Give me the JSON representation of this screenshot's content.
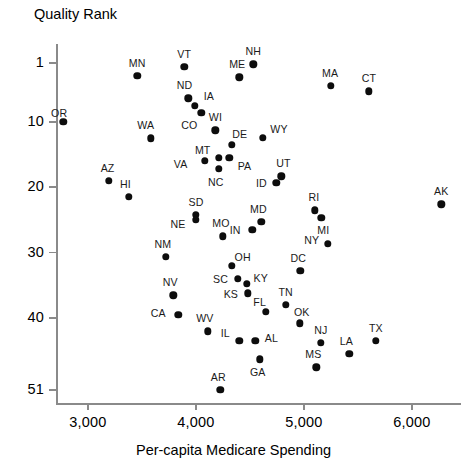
{
  "chart_data": {
    "type": "scatter",
    "title": "",
    "xlabel": "Per-capita Medicare Spending",
    "ylabel": "Quality Rank",
    "xlim": [
      2700,
      6450
    ],
    "ylim": [
      1,
      51
    ],
    "y_inverted": true,
    "grid": false,
    "legend": "none",
    "xticks": [
      3000,
      4000,
      5000,
      6000
    ],
    "xtick_labels": [
      "3,000",
      "4,000",
      "5,000",
      "6,000"
    ],
    "yticks": [
      1,
      10,
      20,
      30,
      40,
      51
    ],
    "ytick_labels": [
      "1",
      "10",
      "20",
      "30",
      "40",
      "51"
    ],
    "point_label_position": "varies",
    "points": [
      {
        "label": "OR",
        "x": 2770,
        "y": 10,
        "lx": -4,
        "ly": -9
      },
      {
        "label": "MN",
        "x": 3455,
        "y": 3,
        "lx": 0,
        "ly": -13
      },
      {
        "label": "VT",
        "x": 3890,
        "y": 1.6,
        "lx": 0,
        "ly": -13
      },
      {
        "label": "NH",
        "x": 4530,
        "y": 1.2,
        "lx": 0,
        "ly": -13
      },
      {
        "label": "ME",
        "x": 4400,
        "y": 3.2,
        "lx": -2,
        "ly": -13
      },
      {
        "label": "MA",
        "x": 5250,
        "y": 4.5,
        "lx": -1,
        "ly": -13
      },
      {
        "label": "CT",
        "x": 5600,
        "y": 5.3,
        "lx": 0,
        "ly": -13
      },
      {
        "label": "ND",
        "x": 3930,
        "y": 6.4,
        "lx": -4,
        "ly": -13
      },
      {
        "label": "IA",
        "x": 3990,
        "y": 7.5,
        "lx": 14,
        "ly": -10
      },
      {
        "label": "CO",
        "x": 4050,
        "y": 8.6,
        "lx": -12,
        "ly": 12
      },
      {
        "label": "WA",
        "x": 3580,
        "y": 12.5,
        "lx": -5,
        "ly": -13
      },
      {
        "label": "WI",
        "x": 4180,
        "y": 11.3,
        "lx": 0,
        "ly": -13
      },
      {
        "label": "DE",
        "x": 4330,
        "y": 13.5,
        "lx": 8,
        "ly": -11
      },
      {
        "label": "WY",
        "x": 4620,
        "y": 12.4,
        "lx": 16,
        "ly": -9
      },
      {
        "label": "MT",
        "x": 4210,
        "y": 15.5,
        "lx": -16,
        "ly": -8
      },
      {
        "label": "PA",
        "x": 4310,
        "y": 15.5,
        "lx": 15,
        "ly": 8
      },
      {
        "label": "VA",
        "x": 4080,
        "y": 16.0,
        "lx": -24,
        "ly": 3
      },
      {
        "label": "NC",
        "x": 4210,
        "y": 17.2,
        "lx": -3,
        "ly": 13
      },
      {
        "label": "UT",
        "x": 4790,
        "y": 18.3,
        "lx": 2,
        "ly": -13
      },
      {
        "label": "ID",
        "x": 4745,
        "y": 19.3,
        "lx": -15,
        "ly": 0
      },
      {
        "label": "AZ",
        "x": 3190,
        "y": 19.0,
        "lx": -1,
        "ly": -13
      },
      {
        "label": "HI",
        "x": 3375,
        "y": 21.5,
        "lx": -3,
        "ly": -13
      },
      {
        "label": "AK",
        "x": 6270,
        "y": 22.6,
        "lx": 0,
        "ly": -13
      },
      {
        "label": "SD",
        "x": 4000,
        "y": 24.2,
        "lx": 0,
        "ly": -13
      },
      {
        "label": "NE",
        "x": 4000,
        "y": 25.0,
        "lx": -18,
        "ly": 4
      },
      {
        "label": "RI",
        "x": 5100,
        "y": 23.5,
        "lx": -1,
        "ly": -13
      },
      {
        "label": "MI",
        "x": 5160,
        "y": 24.7,
        "lx": 2,
        "ly": 12
      },
      {
        "label": "MD",
        "x": 4605,
        "y": 25.3,
        "lx": -3,
        "ly": -13
      },
      {
        "label": "MO",
        "x": 4250,
        "y": 27.5,
        "lx": -2,
        "ly": -13
      },
      {
        "label": "IN",
        "x": 4520,
        "y": 26.5,
        "lx": -17,
        "ly": 0
      },
      {
        "label": "NY",
        "x": 5220,
        "y": 28.6,
        "lx": -16,
        "ly": -4
      },
      {
        "label": "NM",
        "x": 3720,
        "y": 30.6,
        "lx": -3,
        "ly": -13
      },
      {
        "label": "OH",
        "x": 4330,
        "y": 32.0,
        "lx": 11,
        "ly": -9
      },
      {
        "label": "SC",
        "x": 4385,
        "y": 34.0,
        "lx": -17,
        "ly": 0
      },
      {
        "label": "KY",
        "x": 4470,
        "y": 34.8,
        "lx": 14,
        "ly": -6
      },
      {
        "label": "DC",
        "x": 4965,
        "y": 32.8,
        "lx": -2,
        "ly": -13
      },
      {
        "label": "KS",
        "x": 4480,
        "y": 36.2,
        "lx": -17,
        "ly": 1
      },
      {
        "label": "NV",
        "x": 3790,
        "y": 36.5,
        "lx": -3,
        "ly": -13
      },
      {
        "label": "TN",
        "x": 4830,
        "y": 38.0,
        "lx": 0,
        "ly": -13
      },
      {
        "label": "FL",
        "x": 4645,
        "y": 39.0,
        "lx": -6,
        "ly": -10
      },
      {
        "label": "OK",
        "x": 4960,
        "y": 40.8,
        "lx": 2,
        "ly": -11
      },
      {
        "label": "CA",
        "x": 3835,
        "y": 39.5,
        "lx": -20,
        "ly": -2
      },
      {
        "label": "WV",
        "x": 4110,
        "y": 42.0,
        "lx": -3,
        "ly": -13
      },
      {
        "label": "IL",
        "x": 4400,
        "y": 43.5,
        "lx": -14,
        "ly": -8
      },
      {
        "label": "AL",
        "x": 4550,
        "y": 43.5,
        "lx": 16,
        "ly": -3
      },
      {
        "label": "NJ",
        "x": 5155,
        "y": 43.8,
        "lx": 0,
        "ly": -13
      },
      {
        "label": "TX",
        "x": 5665,
        "y": 43.5,
        "lx": 0,
        "ly": -13
      },
      {
        "label": "GA",
        "x": 4590,
        "y": 46.3,
        "lx": -2,
        "ly": 13
      },
      {
        "label": "LA",
        "x": 5420,
        "y": 45.5,
        "lx": -3,
        "ly": -13
      },
      {
        "label": "MS",
        "x": 5115,
        "y": 47.5,
        "lx": -3,
        "ly": -13
      },
      {
        "label": "AR",
        "x": 4225,
        "y": 51.0,
        "lx": -2,
        "ly": -13
      }
    ]
  },
  "axes": {
    "y_title": "Quality Rank",
    "x_title": "Per-capita Medicare Spending"
  },
  "colors": {
    "point": "#0d0d0d",
    "axis": "#8a8a8a",
    "text": "#000000"
  }
}
